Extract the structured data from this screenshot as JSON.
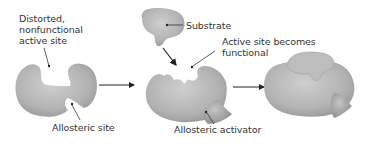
{
  "diagram": {
    "type": "allosteric-activation",
    "labels": {
      "distorted_site": "Distorted,\nnonfunctional\nactive site",
      "allosteric_site": "Allosteric site",
      "substrate": "Substrate",
      "active_site_functional": "Active site becomes\nfunctional",
      "allosteric_activator": "Allosteric activator"
    },
    "colors": {
      "enzyme_fill": "#b4b4b4",
      "enzyme_shade": "#8e8e8e",
      "activator_fill": "#a8a8a8",
      "line": "#333333",
      "text": "#333333"
    },
    "stages": [
      {
        "name": "inactive-enzyme"
      },
      {
        "name": "enzyme-activator-substrate"
      },
      {
        "name": "active-complex"
      }
    ]
  }
}
